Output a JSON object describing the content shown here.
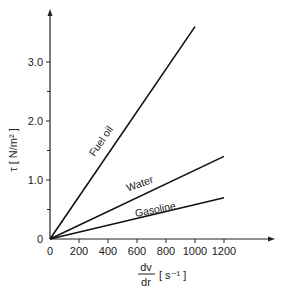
{
  "chart_data": {
    "type": "line",
    "title": "",
    "xlabel_numerator": "dv",
    "xlabel_denominator": "dr",
    "xlabel_unit": "[ s⁻¹ ]",
    "ylabel": "τ [ N/m² ]",
    "xlim": [
      0,
      1400
    ],
    "ylim": [
      0,
      3.8
    ],
    "x_ticks": [
      "0",
      "200",
      "400",
      "600",
      "800",
      "1000",
      "1200"
    ],
    "x_tick_values": [
      0,
      200,
      400,
      600,
      800,
      1000,
      1200
    ],
    "y_ticks": [
      "0",
      "1.0",
      "2.0",
      "3.0"
    ],
    "y_tick_values": [
      0,
      1.0,
      2.0,
      3.0
    ],
    "y_minor_ticks": [
      0.5,
      1.5,
      2.5
    ],
    "grid": false,
    "legend": "inline labels along lines",
    "series": [
      {
        "name": "Fuel oil",
        "x": [
          0,
          1000
        ],
        "values": [
          0,
          3.6
        ]
      },
      {
        "name": "Water",
        "x": [
          0,
          1200
        ],
        "values": [
          0,
          1.4
        ]
      },
      {
        "name": "Gasoline",
        "x": [
          0,
          1200
        ],
        "values": [
          0,
          0.7
        ]
      }
    ]
  }
}
